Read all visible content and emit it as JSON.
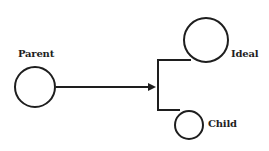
{
  "diagram": {
    "nodes": [
      {
        "id": "parent",
        "label": "Parent"
      },
      {
        "id": "ideal",
        "label": "Ideal"
      },
      {
        "id": "child",
        "label": "Child"
      }
    ],
    "edges": [
      {
        "from": "parent",
        "to": [
          "ideal",
          "child"
        ],
        "type": "arrow-to-bracket"
      }
    ],
    "colors": {
      "stroke": "#1e1e1e",
      "background": "#ffffff"
    }
  }
}
